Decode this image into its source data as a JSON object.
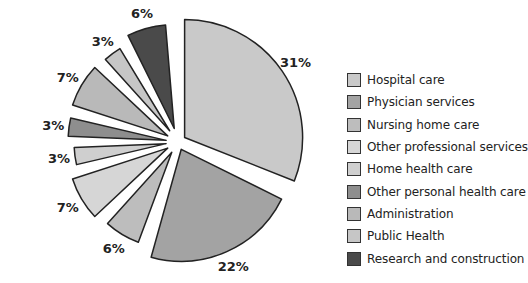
{
  "chart_data": {
    "type": "pie",
    "title": "",
    "exploded": true,
    "start_angle_deg": 0,
    "direction": "clockwise",
    "categories": [
      "Hospital care",
      "Physician services",
      "Nursing home care",
      "Other professional services",
      "Home health care",
      "Other personal health care",
      "Administration",
      "Public Health",
      "Research and construction"
    ],
    "values": [
      31,
      22,
      6,
      7,
      3,
      3,
      7,
      3,
      6
    ],
    "labels": [
      "31%",
      "22%",
      "6%",
      "7%",
      "3%",
      "3%",
      "7%",
      "3%",
      "6%"
    ],
    "colors": [
      "#c9c9c9",
      "#a3a3a3",
      "#bdbdbd",
      "#d6d6d6",
      "#cfcfcf",
      "#8e8e8e",
      "#b9b9b9",
      "#c6c6c6",
      "#4a4a4a"
    ],
    "legend_position": "right"
  },
  "legend": {
    "items": [
      {
        "label": "Hospital care",
        "color": "#c9c9c9"
      },
      {
        "label": "Physician services",
        "color": "#a3a3a3"
      },
      {
        "label": "Nursing home care",
        "color": "#bdbdbd"
      },
      {
        "label": "Other professional services",
        "color": "#d6d6d6"
      },
      {
        "label": "Home health care",
        "color": "#cfcfcf"
      },
      {
        "label": "Other personal health care",
        "color": "#8e8e8e"
      },
      {
        "label": "Administration",
        "color": "#b9b9b9"
      },
      {
        "label": "Public Health",
        "color": "#c6c6c6"
      },
      {
        "label": "Research and construction",
        "color": "#4a4a4a"
      }
    ]
  }
}
